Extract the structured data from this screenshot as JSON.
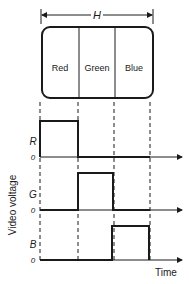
{
  "diagram": {
    "width_label": "H",
    "screen_bands": [
      {
        "label": "Red"
      },
      {
        "label": "Green"
      },
      {
        "label": "Blue"
      }
    ],
    "y_axis_label": "Video voltage",
    "x_axis_label": "Time",
    "traces": [
      {
        "signal": "R",
        "zero_label": "0",
        "active_band": "Red"
      },
      {
        "signal": "G",
        "zero_label": "0",
        "active_band": "Green"
      },
      {
        "signal": "B",
        "zero_label": "0",
        "active_band": "Blue"
      }
    ],
    "colors": {
      "line": "#1a1a1a",
      "background": "#ffffff"
    }
  }
}
